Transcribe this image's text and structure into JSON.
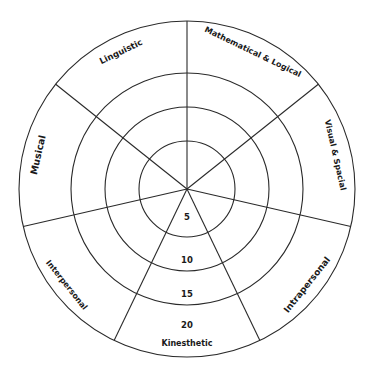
{
  "diagram": {
    "center": [
      187,
      189
    ],
    "radii": [
      48,
      82,
      116,
      168
    ],
    "segments": [
      {
        "label": "Mathematical & Logical",
        "angle": -64.3,
        "font_size": 8
      },
      {
        "label": "Visual & Spacial",
        "angle": -12.9,
        "font_size": 8
      },
      {
        "label": "Intrapersonal",
        "angle": 38.6,
        "font_size": 9
      },
      {
        "label": "Kinesthetic",
        "angle": 90,
        "font_size": 8
      },
      {
        "label": "Interpersonal",
        "angle": 141.4,
        "font_size": 8
      },
      {
        "label": "Musical",
        "angle": 192.9,
        "font_size": 9.5
      },
      {
        "label": "Linguistic",
        "angle": 244.3,
        "font_size": 8.5
      }
    ],
    "spoke_angles": [
      -90,
      -38.6,
      12.9,
      64.3,
      115.7,
      167.1,
      218.6
    ],
    "scale": [
      {
        "label": "5",
        "r": 28
      },
      {
        "label": "10",
        "r": 71
      },
      {
        "label": "15",
        "r": 105
      },
      {
        "label": "20",
        "r": 136
      }
    ],
    "colors": {
      "line": "#2a2a2a",
      "text": "#1a1a1a",
      "background": "#ffffff"
    }
  }
}
